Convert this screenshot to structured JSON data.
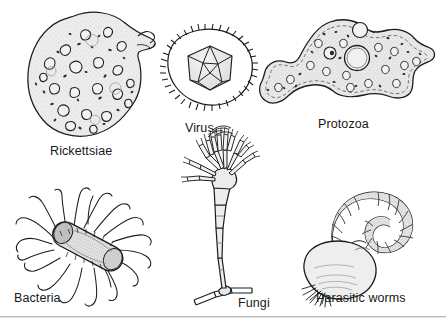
{
  "figure": {
    "background_color": "#ffffff",
    "ink_color": "#1b1d1f",
    "fill_color": "#ebebeb",
    "rule_color": "#b9bcbe",
    "width": 446,
    "height": 328
  },
  "items": [
    {
      "id": "rickettsiae",
      "label": "Rickettsiae",
      "label_x": 50,
      "label_y": 145,
      "icon": "rickettsiae-cell-icon",
      "description": "Irregular rounded cell filled with many small dark inclusions and a small bud at upper right"
    },
    {
      "id": "virus",
      "label": "Virus",
      "label_x": 185,
      "label_y": 122,
      "icon": "virus-icosahedron-icon",
      "description": "Icosahedral capsid enclosed by a rounded spiked envelope"
    },
    {
      "id": "protozoa",
      "label": "Protozoa",
      "label_x": 318,
      "label_y": 118,
      "icon": "protozoa-amoeba-icon",
      "description": "Amoeba with pseudopods, large nucleus and contractile vacuoles, granular cytoplasm"
    },
    {
      "id": "bacteria",
      "label": "Bacteria",
      "label_x": 14,
      "label_y": 292,
      "icon": "bacteria-bacillus-icon",
      "description": "Rod-shaped bacillus covered with numerous long wavy flagella"
    },
    {
      "id": "fungi",
      "label": "Fungi",
      "label_x": 238,
      "label_y": 297,
      "icon": "fungi-conidiophore-icon",
      "description": "Penicillium-like conidiophore with a brush of phialides on a segmented stalk rising from a hypha"
    },
    {
      "id": "parasitic-worms",
      "label": "Parasitic worms",
      "label_x": 316,
      "label_y": 292,
      "icon": "parasitic-worm-icon",
      "description": "S-curved segmented worm attached to a large bulbous sac with bristles"
    }
  ]
}
